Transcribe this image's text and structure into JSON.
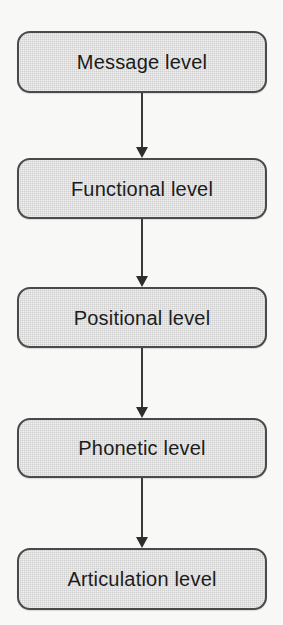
{
  "diagram": {
    "type": "flowchart",
    "orientation": "vertical-top-down",
    "background_color": "#f8f8f6",
    "node_fill_color": "#cfcfcf",
    "node_border_color": "#4a4a4a",
    "arrow_color": "#2e2e2e",
    "text_color": "#1c1c1c",
    "nodes": [
      {
        "id": "message",
        "label": "Message level"
      },
      {
        "id": "functional",
        "label": "Functional level"
      },
      {
        "id": "positional",
        "label": "Positional level"
      },
      {
        "id": "phonetic",
        "label": "Phonetic level"
      },
      {
        "id": "articulation",
        "label": "Articulation level"
      }
    ],
    "connectors": [
      {
        "id": "arrow-0",
        "from": "message",
        "to": "functional",
        "icon": "arrow-down-icon"
      },
      {
        "id": "arrow-1",
        "from": "functional",
        "to": "positional",
        "icon": "arrow-down-icon"
      },
      {
        "id": "arrow-2",
        "from": "positional",
        "to": "phonetic",
        "icon": "arrow-down-icon"
      },
      {
        "id": "arrow-3",
        "from": "phonetic",
        "to": "articulation",
        "icon": "arrow-down-icon"
      }
    ]
  }
}
